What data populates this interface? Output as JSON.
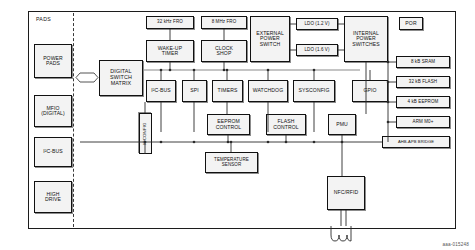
{
  "figure": {
    "id_label": "aaa-015248",
    "pads_column_label": "PADS",
    "accent_line_color": "#2a2a2a",
    "block_fill_color": "#f3f3f3",
    "block_border_color": "#111111"
  },
  "pads_blocks": [
    {
      "name": "power-pads",
      "label": "POWER\nPADS"
    },
    {
      "name": "mfio-digital",
      "label": "MFIO\n(DIGITAL)"
    },
    {
      "name": "i2c-bus-pad",
      "label": "I²C-BUS"
    },
    {
      "name": "high-drive",
      "label": "HIGH\nDRIVE"
    }
  ],
  "core_blocks": {
    "digital_switch_matrix": "DIGITAL\nSWITCH\nMATRIX",
    "fro_32khz": "32 kHz FRO",
    "fro_8mhz": "8 MHz FRO",
    "wakeup_timer": "WAKE-UP\nTIMER",
    "clock_shop": "CLOCK\nSHOP",
    "external_power_switch": "EXTERNAL\nPOWER\nSWITCH",
    "ldo_12v": "LDO (1.2 V)",
    "ldo_16v": "LDO (1.6 V)",
    "internal_power_switches": "INTERNAL\nPOWER\nSWITCHES",
    "por": "POR",
    "i2c_bus": "I²C-BUS",
    "spi": "SPI",
    "timers": "TIMERS",
    "watchdog": "WATCHDOG",
    "sysconfig": "SYSCONFIG",
    "gpio": "GPIO",
    "ioconfig": "IOCONFIG",
    "eeprom_control": "EEPROM\nCONTROL",
    "flash_control": "FLASH\nCONTROL",
    "pmu": "PMU",
    "temperature_sensor": "TEMPERATURE\nSENSOR",
    "nfc_rfid": "NFC/RFID"
  },
  "memory_blocks": [
    {
      "name": "sram-8kb",
      "label": "8 kB SRAM"
    },
    {
      "name": "flash-32kb",
      "label": "32 kB FLASH"
    },
    {
      "name": "eeprom-4kb",
      "label": "4 kB EEPROM"
    },
    {
      "name": "arm-m0plus",
      "label": "ARM M0+"
    },
    {
      "name": "ahb-apb-bridge",
      "label": "AHB-APB BRIDGE"
    }
  ]
}
